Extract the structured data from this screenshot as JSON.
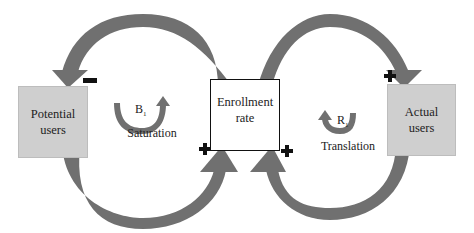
{
  "nodes": {
    "potential_users": {
      "label_line1": "Potential",
      "label_line2": "users"
    },
    "enrollment_rate": {
      "label_line1": "Enrollment",
      "label_line2": "rate"
    },
    "actual_users": {
      "label_line1": "Actual",
      "label_line2": "users"
    }
  },
  "loops": {
    "balancing": {
      "id_letter": "B",
      "id_sub": "1",
      "name": "Saturation"
    },
    "reinforcing": {
      "id_letter": "R",
      "id_sub": "1",
      "name": "Translation"
    }
  },
  "polarities": {
    "enrollment_to_potential": "−",
    "potential_to_enrollment": "+",
    "actual_to_enrollment": "+",
    "enrollment_to_actual": "+"
  },
  "colors": {
    "arrow": "#6e6e6e",
    "stock_fill": "#cfcfcf",
    "arrow_tail": "#555555"
  }
}
